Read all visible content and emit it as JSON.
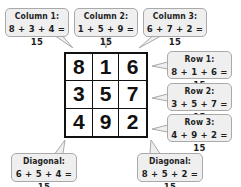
{
  "magic_square": {
    "rows": [
      [
        "8",
        "1",
        "6"
      ],
      [
        "3",
        "5",
        "7"
      ],
      [
        "4",
        "9",
        "2"
      ]
    ],
    "magic_sum": "15"
  },
  "callouts": {
    "column1": {
      "title": "Column 1:",
      "expr": "8 + 3 + 4 = 15"
    },
    "column2": {
      "title": "Column 2:",
      "expr": "1 + 5 + 9 = 15"
    },
    "column3": {
      "title": "Column 3:",
      "expr": "6 + 7 + 2 = 15"
    },
    "row1": {
      "title": "Row 1:",
      "expr": "8 + 1 + 6 = 15"
    },
    "row2": {
      "title": "Row 2:",
      "expr": "3 + 5 + 7 = 15"
    },
    "row3": {
      "title": "Row 3:",
      "expr": "4 + 9 + 2 = 15"
    },
    "diagonal1": {
      "title": "Diagonal:",
      "expr": "6 + 5 + 4 = 15"
    },
    "diagonal2": {
      "title": "Diagonal:",
      "expr": "8 + 5 + 2 = 15"
    }
  },
  "colors": {
    "bubble_fill": "#efefef",
    "bubble_border": "#a9a9a9",
    "grid_line": "#111111",
    "text": "#1e1e1e"
  }
}
